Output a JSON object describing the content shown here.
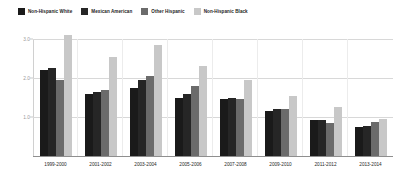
{
  "chart_data": {
    "type": "bar",
    "title": "",
    "subtitle": "",
    "xlabel": "",
    "ylabel": "",
    "ylim": [
      0,
      3.0
    ],
    "yticks": [
      "3.0",
      "2.0",
      "1.0"
    ],
    "ytick_values": [
      3.0,
      2.0,
      1.0
    ],
    "grid": true,
    "legend_position": "top-left",
    "categories": [
      "1999-2000",
      "2001-2002",
      "2003-2004",
      "2005-2006",
      "2007-2008",
      "2009-2010",
      "2011-2012",
      "2013-2014"
    ],
    "series": [
      {
        "name": "Non-Hispanic White",
        "color": "#1a1a1a",
        "values": [
          2.2,
          1.6,
          1.75,
          1.5,
          1.45,
          1.15,
          0.92,
          0.75
        ]
      },
      {
        "name": "Mexican American",
        "color": "#262626",
        "values": [
          2.25,
          1.65,
          1.95,
          1.6,
          1.5,
          1.2,
          0.92,
          0.78
        ]
      },
      {
        "name": "Other Hispanic",
        "color": "#6b6b6b",
        "values": [
          1.95,
          1.7,
          2.05,
          1.8,
          1.45,
          1.2,
          0.85,
          0.88
        ]
      },
      {
        "name": "Non-Hispanic Black",
        "color": "#c8c8c8",
        "values": [
          3.1,
          2.55,
          2.85,
          2.3,
          1.95,
          1.55,
          1.25,
          0.95
        ]
      }
    ]
  },
  "legend": {
    "items": [
      {
        "label": "Non-Hispanic White",
        "swatch": "#1a1a1a"
      },
      {
        "label": "Mexican American",
        "swatch": "#262626"
      },
      {
        "label": "Other Hispanic",
        "swatch": "#6b6b6b"
      },
      {
        "label": "Non-Hispanic Black",
        "swatch": "#c8c8c8"
      }
    ]
  }
}
